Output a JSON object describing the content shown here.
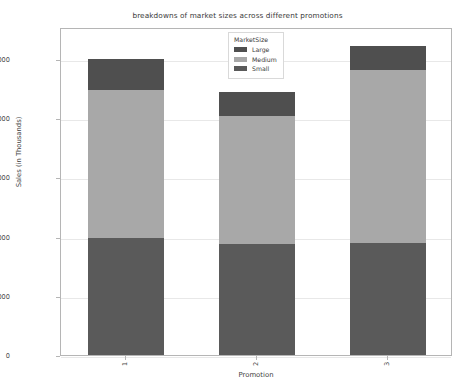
{
  "chart_data": {
    "type": "bar",
    "subtype": "stacked-bar",
    "title": "breakdowns of market sizes across different promotions",
    "xlabel": "Promotion",
    "ylabel": "Sales (in Thousands)",
    "categories": [
      "1",
      "2",
      "3"
    ],
    "series": [
      {
        "name": "Small",
        "values": [
          3950,
          3750,
          3780
        ],
        "color": "#5a5a5a"
      },
      {
        "name": "Medium",
        "values": [
          5000,
          4310,
          5860
        ],
        "color": "#a8a8a8"
      },
      {
        "name": "Large",
        "values": [
          1050,
          810,
          800
        ],
        "color": "#4f4f4f"
      }
    ],
    "stack_order_bottom_to_top": [
      "Small",
      "Medium",
      "Large"
    ],
    "totals": [
      10000,
      8870,
      10440
    ],
    "ylim": [
      0,
      11080
    ],
    "yticks": [
      0,
      2000,
      4000,
      6000,
      8000,
      10000
    ],
    "ytick_labels": [
      "0",
      "2000",
      "4000",
      "6000",
      "8000",
      "10000"
    ],
    "xtick_labels": [
      "1",
      "2",
      "3"
    ],
    "grid": true,
    "grid_axis": "y",
    "legend": {
      "title": "MarketSize",
      "position": "upper center",
      "entries": [
        {
          "label": "Large",
          "color": "#4f4f4f"
        },
        {
          "label": "Medium",
          "color": "#a8a8a8"
        },
        {
          "label": "Small",
          "color": "#5a5a5a"
        }
      ]
    },
    "background_color": "#ffffff",
    "axis_color": "#b5b5b5",
    "grid_color": "#e8e8e8"
  }
}
